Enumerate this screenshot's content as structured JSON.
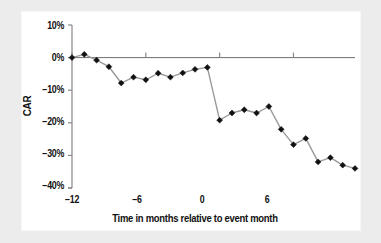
{
  "figure": {
    "background_color": "#ececec",
    "panel_color": "#ffffff",
    "line_color": "#9a9a9a",
    "marker_color": "#111111",
    "axis_color": "#888888",
    "text_color": "#111111"
  },
  "chart_data": {
    "type": "line",
    "title": "",
    "subtitle": "",
    "xlabel": "Time in months relative to event month",
    "ylabel": "CAR",
    "xlim": [
      -12,
      11
    ],
    "ylim": [
      -40,
      10
    ],
    "xticks": [
      -12,
      -6,
      0,
      6
    ],
    "xtick_labels": [
      "−12",
      "−6",
      "0",
      "6"
    ],
    "yticks": [
      10,
      0,
      -10,
      -20,
      -30,
      -40
    ],
    "ytick_labels": [
      "10%",
      "0%",
      "−10%",
      "−20%",
      "−30%",
      "−40%"
    ],
    "grid": false,
    "legend": false,
    "legend_position": "none",
    "marker": "diamond",
    "zero_line": true,
    "x": [
      -12,
      -11,
      -10,
      -9,
      -8,
      -7,
      -6,
      -5,
      -4,
      -3,
      -2,
      -1,
      0,
      1,
      2,
      3,
      4,
      5,
      6,
      7,
      8,
      9,
      10,
      11
    ],
    "values": [
      0.0,
      1.0,
      -0.8,
      -2.8,
      -7.8,
      -6.0,
      -6.8,
      -4.8,
      -6.0,
      -4.7,
      -3.6,
      -3.0,
      -19.2,
      -17.0,
      -16.0,
      -17.0,
      -15.0,
      -22.0,
      -26.7,
      -24.8,
      -32.0,
      -30.7,
      -33.0,
      -34.0
    ],
    "series": [
      {
        "name": "CAR",
        "values": [
          0.0,
          1.0,
          -0.8,
          -2.8,
          -7.8,
          -6.0,
          -6.8,
          -4.8,
          -6.0,
          -4.7,
          -3.6,
          -3.0,
          -19.2,
          -17.0,
          -16.0,
          -17.0,
          -15.0,
          -22.0,
          -26.7,
          -24.8,
          -32.0,
          -30.7,
          -33.0,
          -34.0
        ]
      }
    ]
  }
}
